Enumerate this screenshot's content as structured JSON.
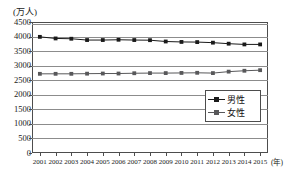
{
  "chart_data": {
    "type": "line",
    "title": "",
    "subtitle": "",
    "xlabel": "(年)",
    "ylabel": "(万人)",
    "ylim": [
      0,
      4500
    ],
    "ytick_step": 500,
    "yticks": [
      4500,
      4000,
      3500,
      3000,
      2500,
      2000,
      1500,
      1000,
      500,
      0
    ],
    "grid": true,
    "grid_axis": "y",
    "legend_position": "inside-right-middle",
    "categories": [
      "2001",
      "2002",
      "2003",
      "2004",
      "2005",
      "2006",
      "2007",
      "2008",
      "2009",
      "2010",
      "2011",
      "2012",
      "2013",
      "2014",
      "2015"
    ],
    "series": [
      {
        "name": "男性",
        "color": "#1a1a1a",
        "marker": "square",
        "values": [
          3990,
          3935,
          3925,
          3880,
          3880,
          3890,
          3880,
          3875,
          3830,
          3815,
          3810,
          3790,
          3755,
          3730,
          3730
        ]
      },
      {
        "name": "女性",
        "color": "#58585a",
        "marker": "square",
        "values": [
          2720,
          2720,
          2720,
          2725,
          2730,
          2730,
          2740,
          2745,
          2745,
          2750,
          2755,
          2745,
          2795,
          2825,
          2845
        ]
      }
    ]
  },
  "legend": {
    "entries": [
      {
        "label": "男性"
      },
      {
        "label": "女性"
      }
    ]
  },
  "colors": {
    "male_line": "#1a1a1a",
    "female_line": "#58585a",
    "frame": "#4d4d4d",
    "gridline": "#8c8c8c",
    "background": "#ffffff"
  }
}
